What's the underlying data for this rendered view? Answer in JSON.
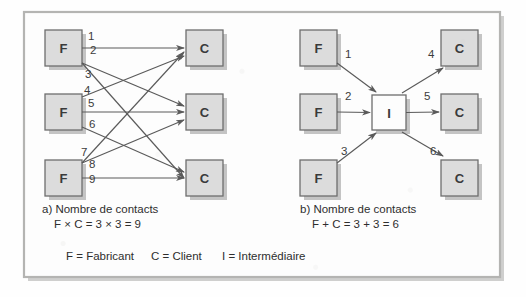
{
  "figure": {
    "background_color": "#fefefe",
    "frame": {
      "border_color": "#b4b4b2",
      "shadow_color": "#a8a8a6",
      "fill_color": "#fdfdfd",
      "x": 24,
      "y": 12,
      "width": 476,
      "height": 265
    },
    "node_style": {
      "fill_color": "#dcdcdc",
      "border_color": "#6e6e6e",
      "shadow_color": "#b0b0b0",
      "intermediary_fill_color": "#fdfdfd",
      "label_color": "#3a3a3a",
      "width": 37,
      "height": 36
    },
    "arrow_color": "#5a5a5a",
    "number_color": "#3c3c3c",
    "text_color": "#2e2e2e"
  },
  "panels": [
    {
      "id": "panel-a",
      "caption_line1": "a) Nombre de contacts",
      "caption_line2": "F × C = 3 × 3 = 9",
      "caption_x": 42,
      "caption_y": 213,
      "sources": [
        {
          "label": "F",
          "x": 45,
          "y": 30
        },
        {
          "label": "F",
          "x": 45,
          "y": 94
        },
        {
          "label": "F",
          "x": 45,
          "y": 160
        }
      ],
      "targets": [
        {
          "label": "C",
          "x": 186,
          "y": 30
        },
        {
          "label": "C",
          "x": 186,
          "y": 94
        },
        {
          "label": "C",
          "x": 186,
          "y": 160
        }
      ],
      "links": [
        {
          "number": "1",
          "from": 0,
          "to": 0,
          "nx": 88,
          "ny": 40
        },
        {
          "number": "2",
          "from": 0,
          "to": 1,
          "nx": 90,
          "ny": 54
        },
        {
          "number": "3",
          "from": 0,
          "to": 2,
          "nx": 85,
          "ny": 78
        },
        {
          "number": "4",
          "from": 1,
          "to": 0,
          "nx": 84,
          "ny": 94
        },
        {
          "number": "5",
          "from": 1,
          "to": 1,
          "nx": 88,
          "ny": 107
        },
        {
          "number": "6",
          "from": 1,
          "to": 2,
          "nx": 89,
          "ny": 128
        },
        {
          "number": "7",
          "from": 2,
          "to": 0,
          "nx": 81,
          "ny": 156
        },
        {
          "number": "8",
          "from": 2,
          "to": 1,
          "nx": 89,
          "ny": 168
        },
        {
          "number": "9",
          "from": 2,
          "to": 2,
          "nx": 89,
          "ny": 183
        }
      ]
    },
    {
      "id": "panel-b",
      "caption_line1": "b) Nombre de contacts",
      "caption_line2": "F + C = 3 + 3 = 6",
      "caption_x": 300,
      "caption_y": 213,
      "sources": [
        {
          "label": "F",
          "x": 300,
          "y": 30
        },
        {
          "label": "F",
          "x": 300,
          "y": 94
        },
        {
          "label": "F",
          "x": 300,
          "y": 160
        }
      ],
      "hub": {
        "label": "I",
        "x": 372,
        "y": 95,
        "width": 34,
        "height": 35
      },
      "targets": [
        {
          "label": "C",
          "x": 441,
          "y": 30
        },
        {
          "label": "C",
          "x": 441,
          "y": 94
        },
        {
          "label": "C",
          "x": 441,
          "y": 160
        }
      ],
      "links": [
        {
          "number": "1",
          "nx": 345,
          "ny": 58
        },
        {
          "number": "2",
          "nx": 345,
          "ny": 100
        },
        {
          "number": "3",
          "nx": 341,
          "ny": 155
        },
        {
          "number": "4",
          "nx": 428,
          "ny": 58
        },
        {
          "number": "5",
          "nx": 424,
          "ny": 100
        },
        {
          "number": "6",
          "nx": 430,
          "ny": 155
        }
      ]
    }
  ],
  "legend": {
    "x": 66,
    "y": 260,
    "entries": [
      {
        "key": "F",
        "value": "F = Fabricant",
        "x": 66
      },
      {
        "key": "C",
        "value": "C = Client",
        "x": 151
      },
      {
        "key": "I",
        "value": "I = Intermédiaire",
        "x": 222
      }
    ]
  }
}
